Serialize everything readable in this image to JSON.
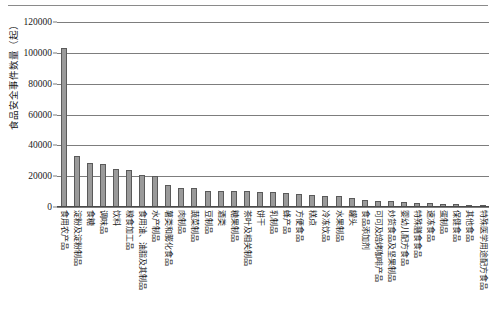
{
  "chart_data": {
    "type": "bar",
    "title": "",
    "xlabel": "",
    "ylabel": "食品安全事件数量（起）",
    "ylim": [
      0,
      120000
    ],
    "yticks": [
      0,
      20000,
      40000,
      60000,
      80000,
      100000,
      120000
    ],
    "ytick_labels": [
      "0",
      "20000",
      "40000",
      "60000",
      "80000",
      "100000",
      "120000"
    ],
    "grid": "horizontal",
    "legend": "none",
    "bar_color": "#9a9a9a",
    "bar_edge_color": "#5a5a5a",
    "categories": [
      "食用农产品",
      "淀粉及淀粉制品",
      "食糖",
      "调味品",
      "饮料",
      "粮食加工品",
      "食用油、油脂及其制品",
      "水产制品",
      "薯类和膨化食品",
      "肉制品",
      "蔬菜制品",
      "豆制品",
      "酒类",
      "糖果制品",
      "茶叶及相关制品",
      "饼干",
      "乳制品",
      "蜂产品",
      "方便食品",
      "糕点",
      "冷冻饮品",
      "水果制品",
      "罐头",
      "食品添加剂",
      "可可及焙烤咖啡产品",
      "炒货食品及坚果制品",
      "婴幼儿配方食品",
      "特殊膳食食品",
      "速冻食品",
      "蛋制品",
      "保健食品",
      "其他食品",
      "特殊医学用途配方食品"
    ],
    "values": [
      103000,
      32500,
      28000,
      27500,
      24000,
      23500,
      20500,
      19500,
      13500,
      12000,
      12000,
      9800,
      9800,
      9500,
      9500,
      9200,
      9000,
      8700,
      8000,
      7300,
      6800,
      6300,
      5500,
      4200,
      3500,
      3200,
      2600,
      2100,
      1800,
      1500,
      1200,
      900,
      400
    ]
  }
}
